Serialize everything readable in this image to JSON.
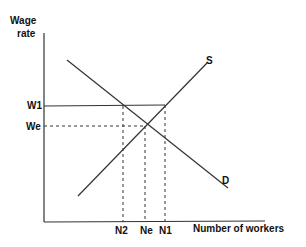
{
  "diagram": {
    "type": "labor-market-supply-demand",
    "y_axis_label_line1": "Wage",
    "y_axis_label_line2": "rate",
    "x_axis_label": "Number of workers",
    "curves": {
      "supply_label": "S",
      "demand_label": "D"
    },
    "wage_levels": {
      "w1": "W1",
      "we": "We"
    },
    "quantity_levels": {
      "n2": "N2",
      "ne": "Ne",
      "n1": "N1"
    },
    "colors": {
      "line": "#333333",
      "text": "#111111",
      "background": "#ffffff"
    }
  }
}
